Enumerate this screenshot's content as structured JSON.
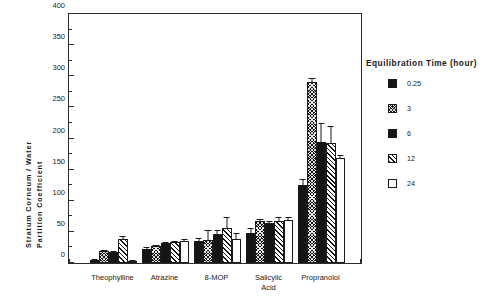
{
  "chart_data": {
    "type": "bar",
    "title": "",
    "xlabel": "",
    "ylabel": "Stratum Corneum / Water Partition Coefficient",
    "ylabel_line1": "Stratum  Corneum  /  Water",
    "ylabel_line2": "Partition    Coefficient",
    "ylim": [
      0,
      400
    ],
    "ytick_step": 50,
    "yminor_step": 25,
    "grid": false,
    "legend_position": "right",
    "legend_title": "Equilibration  Time  (hour)",
    "categories": [
      "Theophylline",
      "Atrazine",
      "8-MOP",
      "Salicylic\nAcid",
      "Propranolol"
    ],
    "ytick_labels": [
      "0",
      "50",
      "100",
      "150",
      "200",
      "250",
      "300",
      "350",
      "400"
    ],
    "series": [
      {
        "name": "0.25",
        "fill": "f-solid",
        "fill_name": "solid-black",
        "values": [
          5,
          23,
          36,
          48,
          126
        ],
        "errors": [
          2,
          2,
          4,
          9,
          9
        ]
      },
      {
        "name": "3",
        "fill": "f-cross",
        "fill_name": "cross-hatch-black",
        "values": [
          20,
          27,
          37,
          67,
          290
        ],
        "errors": [
          1,
          1,
          16,
          4,
          8
        ]
      },
      {
        "name": "6",
        "fill": "f-solid2",
        "fill_name": "solid-black",
        "values": [
          17,
          32,
          47,
          65,
          195
        ],
        "errors": [
          1,
          2,
          6,
          3,
          30
        ]
      },
      {
        "name": "12",
        "fill": "f-diag",
        "fill_name": "diagonal-hatch",
        "values": [
          38,
          34,
          57,
          67,
          193
        ],
        "errors": [
          5,
          2,
          17,
          7,
          27
        ]
      },
      {
        "name": "24",
        "fill": "f-open",
        "fill_name": "open-white",
        "values": [
          4,
          36,
          39,
          69,
          169
        ],
        "errors": [
          1,
          2,
          9,
          5,
          5
        ]
      }
    ]
  },
  "colors": {
    "axis": "#2b2b2b",
    "bar_outline": "#1a1a1a",
    "bar_fill_dark": "#141414",
    "background": "#ffffff"
  }
}
